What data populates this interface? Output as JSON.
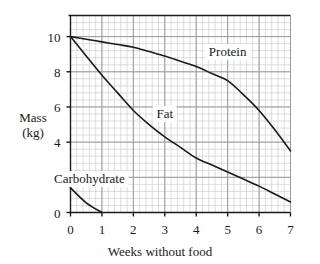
{
  "chart_data": {
    "type": "line",
    "title": "",
    "xlabel": "Weeks without food",
    "ylabel": "Mass (kg)",
    "ylabel_line1": "Mass",
    "ylabel_line2": "(kg)",
    "xlim": [
      0,
      7
    ],
    "ylim": [
      0,
      11.2
    ],
    "grid": true,
    "grid_major_step_x": 1,
    "grid_major_step_y": 2,
    "grid_minor_divisions": 5,
    "legend_position": "inline-annotations",
    "xticks": [
      "0",
      "1",
      "2",
      "3",
      "4",
      "5",
      "6",
      "7"
    ],
    "xtick_values": [
      0,
      1,
      2,
      3,
      4,
      5,
      6,
      7
    ],
    "yticks": [
      "0",
      "2",
      "4",
      "6",
      "8",
      "10"
    ],
    "ytick_values": [
      0,
      2,
      4,
      6,
      8,
      10
    ],
    "x": [
      0,
      0.5,
      1,
      1.5,
      2,
      2.5,
      3,
      3.5,
      4,
      4.5,
      5,
      5.5,
      6,
      6.5,
      7
    ],
    "series": [
      {
        "name": "Protein",
        "label": "Protein",
        "color": "#1a1a1a",
        "label_x": 5.0,
        "label_y": 9.1,
        "values": [
          10.0,
          9.85,
          9.7,
          9.55,
          9.4,
          9.15,
          8.9,
          8.6,
          8.3,
          7.9,
          7.5,
          6.7,
          5.8,
          4.7,
          3.5
        ]
      },
      {
        "name": "Fat",
        "label": "Fat",
        "color": "#1a1a1a",
        "label_x": 3.0,
        "label_y": 5.6,
        "values": [
          10.0,
          8.9,
          7.8,
          6.8,
          5.8,
          5.0,
          4.3,
          3.7,
          3.1,
          2.7,
          2.3,
          1.9,
          1.5,
          1.05,
          0.6
        ]
      },
      {
        "name": "Carbohydrate",
        "label": "Carbohydrate",
        "color": "#1a1a1a",
        "label_x": 0.6,
        "label_y": 1.9,
        "values": [
          1.4,
          0.55,
          0.0,
          null,
          null,
          null,
          null,
          null,
          null,
          null,
          null,
          null,
          null,
          null,
          null
        ]
      }
    ],
    "colors": {
      "axis": "#1a1a1a",
      "curve": "#1a1a1a",
      "grid_major": "#9a9a9a",
      "grid_minor": "#cfcfcf",
      "background": "#ffffff"
    }
  }
}
